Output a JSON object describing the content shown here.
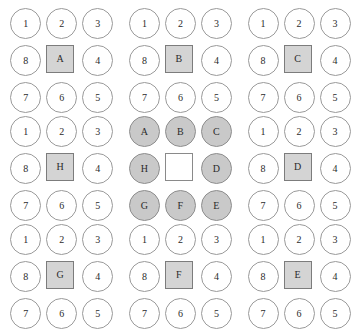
{
  "figure": {
    "type": "neighborhood-cell-diagram-grid",
    "panel_rows": 3,
    "panel_columns": 3,
    "cells_per_panel": 9,
    "colors": {
      "background": "#ffffff",
      "circle_outline": "#9a9a9a",
      "circle_fill_empty": "#ffffff",
      "circle_fill_shaded": "#c9c9c9",
      "square_outline": "#7c7c7c",
      "square_fill_shaded": "#d4d4d4",
      "square_fill_empty": "#ffffff",
      "text": "#2b2b2b"
    },
    "panels": [
      {
        "id": "panel-r1c1",
        "center_label": "A",
        "center_shaded": true,
        "ring_kind": "numbers",
        "cells": [
          {
            "label": "1",
            "shape": "circle",
            "shaded": false
          },
          {
            "label": "2",
            "shape": "circle",
            "shaded": false
          },
          {
            "label": "3",
            "shape": "circle",
            "shaded": false
          },
          {
            "label": "8",
            "shape": "circle",
            "shaded": false
          },
          {
            "label": "A",
            "shape": "square",
            "shaded": true
          },
          {
            "label": "4",
            "shape": "circle",
            "shaded": false
          },
          {
            "label": "7",
            "shape": "circle",
            "shaded": false
          },
          {
            "label": "6",
            "shape": "circle",
            "shaded": false
          },
          {
            "label": "5",
            "shape": "circle",
            "shaded": false
          }
        ]
      },
      {
        "id": "panel-r1c2",
        "center_label": "B",
        "center_shaded": true,
        "ring_kind": "numbers",
        "cells": [
          {
            "label": "1",
            "shape": "circle",
            "shaded": false
          },
          {
            "label": "2",
            "shape": "circle",
            "shaded": false
          },
          {
            "label": "3",
            "shape": "circle",
            "shaded": false
          },
          {
            "label": "8",
            "shape": "circle",
            "shaded": false
          },
          {
            "label": "B",
            "shape": "square",
            "shaded": true
          },
          {
            "label": "4",
            "shape": "circle",
            "shaded": false
          },
          {
            "label": "7",
            "shape": "circle",
            "shaded": false
          },
          {
            "label": "6",
            "shape": "circle",
            "shaded": false
          },
          {
            "label": "5",
            "shape": "circle",
            "shaded": false
          }
        ]
      },
      {
        "id": "panel-r1c3",
        "center_label": "C",
        "center_shaded": true,
        "ring_kind": "numbers",
        "cells": [
          {
            "label": "1",
            "shape": "circle",
            "shaded": false
          },
          {
            "label": "2",
            "shape": "circle",
            "shaded": false
          },
          {
            "label": "3",
            "shape": "circle",
            "shaded": false
          },
          {
            "label": "8",
            "shape": "circle",
            "shaded": false
          },
          {
            "label": "C",
            "shape": "square",
            "shaded": true
          },
          {
            "label": "4",
            "shape": "circle",
            "shaded": false
          },
          {
            "label": "7",
            "shape": "circle",
            "shaded": false
          },
          {
            "label": "6",
            "shape": "circle",
            "shaded": false
          },
          {
            "label": "5",
            "shape": "circle",
            "shaded": false
          }
        ]
      },
      {
        "id": "panel-r2c1",
        "center_label": "H",
        "center_shaded": true,
        "ring_kind": "numbers",
        "cells": [
          {
            "label": "1",
            "shape": "circle",
            "shaded": false
          },
          {
            "label": "2",
            "shape": "circle",
            "shaded": false
          },
          {
            "label": "3",
            "shape": "circle",
            "shaded": false
          },
          {
            "label": "8",
            "shape": "circle",
            "shaded": false
          },
          {
            "label": "H",
            "shape": "square",
            "shaded": true
          },
          {
            "label": "4",
            "shape": "circle",
            "shaded": false
          },
          {
            "label": "7",
            "shape": "circle",
            "shaded": false
          },
          {
            "label": "6",
            "shape": "circle",
            "shaded": false
          },
          {
            "label": "5",
            "shape": "circle",
            "shaded": false
          }
        ]
      },
      {
        "id": "panel-r2c2",
        "center_label": "",
        "center_shaded": false,
        "ring_kind": "letters",
        "cells": [
          {
            "label": "A",
            "shape": "circle",
            "shaded": true
          },
          {
            "label": "B",
            "shape": "circle",
            "shaded": true
          },
          {
            "label": "C",
            "shape": "circle",
            "shaded": true
          },
          {
            "label": "H",
            "shape": "circle",
            "shaded": true
          },
          {
            "label": "",
            "shape": "square",
            "shaded": false
          },
          {
            "label": "D",
            "shape": "circle",
            "shaded": true
          },
          {
            "label": "G",
            "shape": "circle",
            "shaded": true
          },
          {
            "label": "F",
            "shape": "circle",
            "shaded": true
          },
          {
            "label": "E",
            "shape": "circle",
            "shaded": true
          }
        ]
      },
      {
        "id": "panel-r2c3",
        "center_label": "D",
        "center_shaded": true,
        "ring_kind": "numbers",
        "cells": [
          {
            "label": "1",
            "shape": "circle",
            "shaded": false
          },
          {
            "label": "2",
            "shape": "circle",
            "shaded": false
          },
          {
            "label": "3",
            "shape": "circle",
            "shaded": false
          },
          {
            "label": "8",
            "shape": "circle",
            "shaded": false
          },
          {
            "label": "D",
            "shape": "square",
            "shaded": true
          },
          {
            "label": "4",
            "shape": "circle",
            "shaded": false
          },
          {
            "label": "7",
            "shape": "circle",
            "shaded": false
          },
          {
            "label": "6",
            "shape": "circle",
            "shaded": false
          },
          {
            "label": "5",
            "shape": "circle",
            "shaded": false
          }
        ]
      },
      {
        "id": "panel-r3c1",
        "center_label": "G",
        "center_shaded": true,
        "ring_kind": "numbers",
        "cells": [
          {
            "label": "1",
            "shape": "circle",
            "shaded": false
          },
          {
            "label": "2",
            "shape": "circle",
            "shaded": false
          },
          {
            "label": "3",
            "shape": "circle",
            "shaded": false
          },
          {
            "label": "8",
            "shape": "circle",
            "shaded": false
          },
          {
            "label": "G",
            "shape": "square",
            "shaded": true
          },
          {
            "label": "4",
            "shape": "circle",
            "shaded": false
          },
          {
            "label": "7",
            "shape": "circle",
            "shaded": false
          },
          {
            "label": "6",
            "shape": "circle",
            "shaded": false
          },
          {
            "label": "5",
            "shape": "circle",
            "shaded": false
          }
        ]
      },
      {
        "id": "panel-r3c2",
        "center_label": "F",
        "center_shaded": true,
        "ring_kind": "numbers",
        "cells": [
          {
            "label": "1",
            "shape": "circle",
            "shaded": false
          },
          {
            "label": "2",
            "shape": "circle",
            "shaded": false
          },
          {
            "label": "3",
            "shape": "circle",
            "shaded": false
          },
          {
            "label": "8",
            "shape": "circle",
            "shaded": false
          },
          {
            "label": "F",
            "shape": "square",
            "shaded": true
          },
          {
            "label": "4",
            "shape": "circle",
            "shaded": false
          },
          {
            "label": "7",
            "shape": "circle",
            "shaded": false
          },
          {
            "label": "6",
            "shape": "circle",
            "shaded": false
          },
          {
            "label": "5",
            "shape": "circle",
            "shaded": false
          }
        ]
      },
      {
        "id": "panel-r3c3",
        "center_label": "E",
        "center_shaded": true,
        "ring_kind": "numbers",
        "cells": [
          {
            "label": "1",
            "shape": "circle",
            "shaded": false
          },
          {
            "label": "2",
            "shape": "circle",
            "shaded": false
          },
          {
            "label": "3",
            "shape": "circle",
            "shaded": false
          },
          {
            "label": "8",
            "shape": "circle",
            "shaded": false
          },
          {
            "label": "E",
            "shape": "square",
            "shaded": true
          },
          {
            "label": "4",
            "shape": "circle",
            "shaded": false
          },
          {
            "label": "7",
            "shape": "circle",
            "shaded": false
          },
          {
            "label": "6",
            "shape": "circle",
            "shaded": false
          },
          {
            "label": "5",
            "shape": "circle",
            "shaded": false
          }
        ]
      }
    ]
  }
}
